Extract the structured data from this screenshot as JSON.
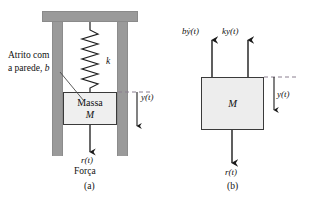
{
  "figure": {
    "background": "#ffffff",
    "wall_color": "#9a9a9a",
    "mass_fill": "#efefef",
    "stroke_color": "#3a3a3a",
    "dashed_color": "#8a7f8f"
  },
  "panel_a": {
    "caption": "(a)",
    "friction_label_line1": "Atrito com",
    "friction_label_line2_prefix": "a parede, ",
    "friction_label_line2_symbol": "b",
    "spring_label": "k",
    "mass_label_line1": "Massa",
    "mass_label_line2": "M",
    "displacement_label": "y(t)",
    "force_label": "r(t)",
    "force_caption": "Força"
  },
  "panel_b": {
    "caption": "(b)",
    "damping_force_label": "bẏ(t)",
    "spring_force_label": "ky(t)",
    "mass_label": "M",
    "displacement_label": "y(t)",
    "applied_force_label": "r(t)"
  }
}
